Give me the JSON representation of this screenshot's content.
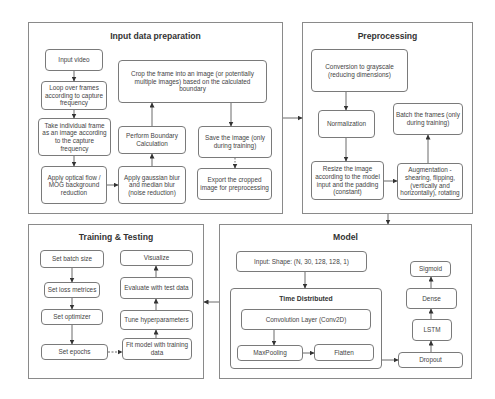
{
  "panels": {
    "input_prep": {
      "title": "Input data preparation",
      "nodes": {
        "input_video": "Input video",
        "loop_frames": "Loop over frames according to capture frequency",
        "take_frame": "Take individual frame as an image according to the capture frequency",
        "optical_flow": "Apply optical flow / MOG background reduction",
        "gaussian_blur": "Apply gaussian blur and median blur (noise reduction)",
        "boundary_calc": "Perform Boundary Calculation",
        "crop_frame": "Crop the frame into an image (or potentially multiple images) based on the calculated boundary",
        "save_image": "Save the image (only during training)",
        "export_image": "Export the cropped image for preprocessing"
      }
    },
    "preprocessing": {
      "title": "Preprocessing",
      "nodes": {
        "grayscale": "Conversion to grayscale (reducing dimensions)",
        "normalization": "Normalization",
        "resize": "Resize the image according to the model input and the padding (constant)",
        "augmentation": "Augmentation - shearing, flipping, (vertically and horizontally), rotating",
        "batch": "Batch the frames (only during training)"
      }
    },
    "model": {
      "title": "Model",
      "nodes": {
        "input_shape": "Input: Shape: (N, 30, 128, 128, 1)",
        "time_distributed": "Time Distributed",
        "conv2d": "Convolution Layer (Conv2D)",
        "maxpooling": "MaxPooling",
        "flatten": "Flatten",
        "dropout": "Dropout",
        "lstm": "LSTM",
        "dense": "Dense",
        "sigmoid": "Sigmoid"
      }
    },
    "training": {
      "title": "Training & Testing",
      "nodes": {
        "batch_size": "Set batch size",
        "loss_metrics": "Set loss metrices",
        "optimizer": "Set optimizer",
        "epochs": "Set epochs",
        "fit_model": "Fit model with training data",
        "tune": "Tune hyperparameters",
        "evaluate": "Evaluate with test data",
        "visualize": "Visualize"
      }
    }
  }
}
